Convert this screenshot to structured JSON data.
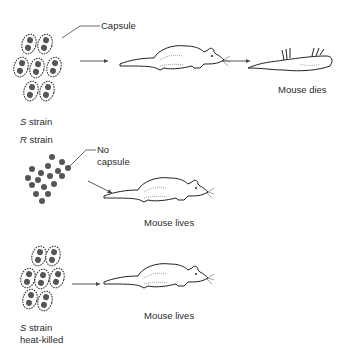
{
  "diagram": {
    "rows": [
      {
        "strain_letter": "S",
        "strain_suffix": " strain",
        "strain_note": "",
        "callout": "Capsule",
        "outcome": "Mouse dies"
      },
      {
        "strain_letter": "R",
        "strain_suffix": " strain",
        "strain_note": "",
        "callout_line1": "No",
        "callout_line2": "capsule",
        "outcome": "Mouse lives"
      },
      {
        "strain_letter": "S",
        "strain_suffix": " strain",
        "strain_note": "heat-killed",
        "outcome": "Mouse lives"
      }
    ],
    "colors": {
      "ink": "#2a2a2a",
      "cell_dot": "#555555",
      "background": "#ffffff"
    }
  }
}
